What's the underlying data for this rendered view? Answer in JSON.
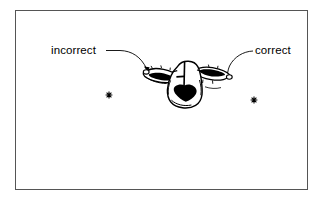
{
  "figure": {
    "type": "line-drawing-diagram",
    "background_color": "#ffffff",
    "ink_color": "#000000",
    "frame": {
      "border_color": "#555555",
      "x": 15,
      "y": 10,
      "width": 293,
      "height": 180
    },
    "callouts": [
      {
        "id": "incorrect",
        "label": "incorrect",
        "label_x": 51,
        "label_y": 44,
        "leader_from_x": 106,
        "leader_from_y": 50,
        "leader_to_x": 148,
        "leader_to_y": 72,
        "points_at": "left eye"
      },
      {
        "id": "correct",
        "label": "correct",
        "label_x": 255,
        "label_y": 44,
        "leader_from_x": 252,
        "leader_from_y": 51,
        "leader_to_x": 228,
        "leader_to_y": 79,
        "points_at": "right eye"
      }
    ],
    "markers": [
      {
        "id": "left-asterisk",
        "glyph": "asterisk-marker",
        "x": 109,
        "y": 95
      },
      {
        "id": "right-asterisk",
        "glyph": "asterisk-marker",
        "x": 254,
        "y": 100
      }
    ]
  }
}
